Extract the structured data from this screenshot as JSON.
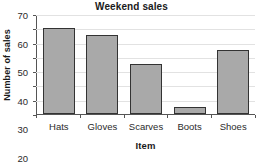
{
  "chart_data": {
    "type": "bar",
    "title": "Weekend sales",
    "xlabel": "Item",
    "ylabel": "Number of sales",
    "categories": [
      "Hats",
      "Gloves",
      "Scarves",
      "Boots",
      "Shoes"
    ],
    "values": [
      60,
      55,
      35,
      5,
      45
    ],
    "ylim": [
      0,
      70
    ],
    "ytick_step": 10,
    "yticks": [
      0,
      10,
      20,
      30,
      40,
      50,
      60,
      70
    ],
    "ytick_labels": [
      "0",
      "10",
      "20",
      "30",
      "40",
      "50",
      "60",
      "70"
    ],
    "grid": true,
    "grid_axis": "y",
    "legend": false,
    "legend_position": "none",
    "bar_fill_color": "#a9a9a9",
    "bar_edge_color": "#333333",
    "grid_color": "#e2e2e2",
    "axis_color": "#555555",
    "background_color": "#ffffff",
    "text_color": "#1a1a1a"
  }
}
